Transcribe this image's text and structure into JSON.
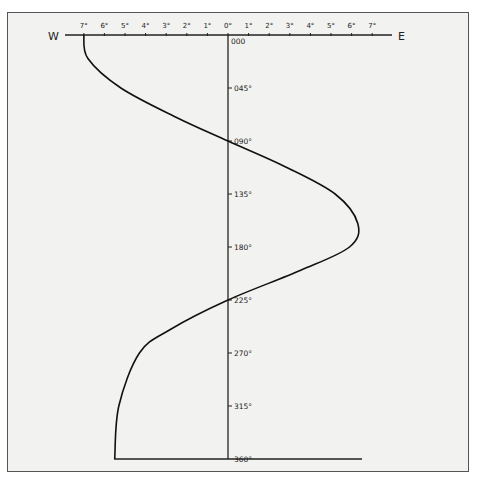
{
  "chart_data": {
    "type": "line",
    "title": "",
    "xlabel_left": "W",
    "xlabel_right": "E",
    "ylabel": "",
    "x_ticks": [
      "7°",
      "6°",
      "5°",
      "4°",
      "3°",
      "2°",
      "1°",
      "0°",
      "1°",
      "2°",
      "3°",
      "4°",
      "5°",
      "6°",
      "7°"
    ],
    "x_values": [
      -7,
      -6,
      -5,
      -4,
      -3,
      -2,
      -1,
      0,
      1,
      2,
      3,
      4,
      5,
      6,
      7
    ],
    "y_ticks": [
      "000",
      "045°",
      "090°",
      "135°",
      "180°",
      "225°",
      "270°",
      "315°",
      "360°"
    ],
    "y_values": [
      0,
      45,
      90,
      135,
      180,
      225,
      270,
      315,
      360
    ],
    "xlim": [
      -7,
      7
    ],
    "ylim": [
      0,
      360
    ],
    "grid": false,
    "series": [
      {
        "name": "deviation curve",
        "points": [
          {
            "heading": 0,
            "deviation": -7.0
          },
          {
            "heading": 20,
            "deviation": -6.8
          },
          {
            "heading": 45,
            "deviation": -5.2
          },
          {
            "heading": 70,
            "deviation": -2.5
          },
          {
            "heading": 90,
            "deviation": 0.0
          },
          {
            "heading": 112,
            "deviation": 2.8
          },
          {
            "heading": 135,
            "deviation": 5.2
          },
          {
            "heading": 160,
            "deviation": 6.3
          },
          {
            "heading": 180,
            "deviation": 5.9
          },
          {
            "heading": 200,
            "deviation": 3.5
          },
          {
            "heading": 225,
            "deviation": 0.0
          },
          {
            "heading": 250,
            "deviation": -2.8
          },
          {
            "heading": 270,
            "deviation": -4.3
          },
          {
            "heading": 315,
            "deviation": -5.3
          },
          {
            "heading": 360,
            "deviation": -5.5
          }
        ]
      }
    ]
  }
}
